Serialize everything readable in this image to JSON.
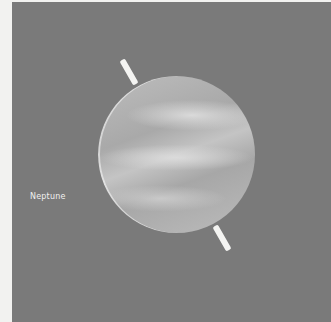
{
  "image": {
    "subject": "planet illustration",
    "label": "Neptune",
    "colors": {
      "background": "#7a7a7a",
      "planet": "#b5b5b5",
      "axis": "#f4f4f2",
      "label": "#f0f0f0"
    }
  }
}
